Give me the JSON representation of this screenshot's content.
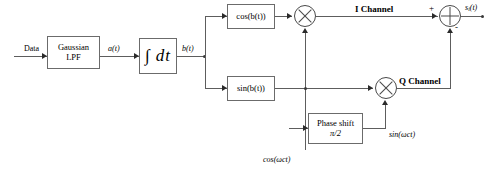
{
  "diagram": {
    "blocks": {
      "gaussian_lpf": {
        "line1": "Gaussian",
        "line2": "LPF"
      },
      "integrator": {
        "symbol": "∫ dt"
      },
      "cos_block": {
        "label": "cos(b(t))"
      },
      "sin_block": {
        "label": "sin(b(t))"
      },
      "phase_shift": {
        "line1": "Phase shift",
        "line2": "π/2"
      }
    },
    "signal_labels": {
      "data_in": "Data",
      "after_lpf": "a(t)",
      "after_integrator": "b(t)",
      "carrier_cos": "cos(ωct)",
      "carrier_sin": "sin(ωct)",
      "i_channel": "I Channel",
      "q_channel": "Q Channel",
      "output": "si(t)",
      "output_base": "s",
      "output_sub": "i",
      "output_tail": "(t)"
    },
    "operators": {
      "multiplier_i": "multiply",
      "multiplier_q": "multiply",
      "summer": "sum",
      "sum_plus": "+",
      "sum_minus": "-"
    },
    "colors": {
      "wire": "#5d5d5d",
      "block_border": "#6b6b6b",
      "background": "#ffffff",
      "text": "#000000"
    }
  }
}
